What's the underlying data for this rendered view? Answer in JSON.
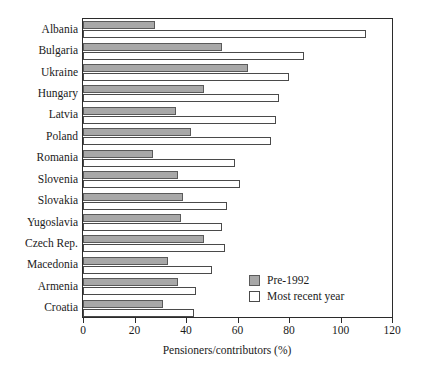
{
  "chart_data": {
    "type": "bar",
    "orientation": "horizontal",
    "title": "",
    "xlabel": "Pensioners/contributors (%)",
    "ylabel": "",
    "xlim": [
      0,
      120
    ],
    "xticks": [
      0,
      20,
      40,
      60,
      80,
      100,
      120
    ],
    "grid": false,
    "legend_position": "inside-bottom-right",
    "categories": [
      "Albania",
      "Bulgaria",
      "Ukraine",
      "Hungary",
      "Latvia",
      "Poland",
      "Romania",
      "Slovenia",
      "Slovakia",
      "Yugoslavia",
      "Czech Rep.",
      "Macedonia",
      "Armenia",
      "Croatia"
    ],
    "series": [
      {
        "name": "Pre-1992",
        "color": "#a8a8a8",
        "values": [
          28,
          54,
          64,
          47,
          36,
          42,
          27,
          37,
          39,
          38,
          47,
          33,
          37,
          31
        ]
      },
      {
        "name": "Most recent year",
        "color": "#ffffff",
        "values": [
          110,
          86,
          80,
          76,
          75,
          73,
          59,
          61,
          56,
          54,
          55,
          50,
          44,
          43
        ]
      }
    ]
  },
  "axis": {
    "x_tick_labels": [
      "0",
      "20",
      "40",
      "60",
      "80",
      "100",
      "120"
    ],
    "x_title": "Pensioners/contributors (%)"
  },
  "legend": {
    "entries": [
      {
        "label": "Pre-1992"
      },
      {
        "label": "Most recent year"
      }
    ]
  }
}
